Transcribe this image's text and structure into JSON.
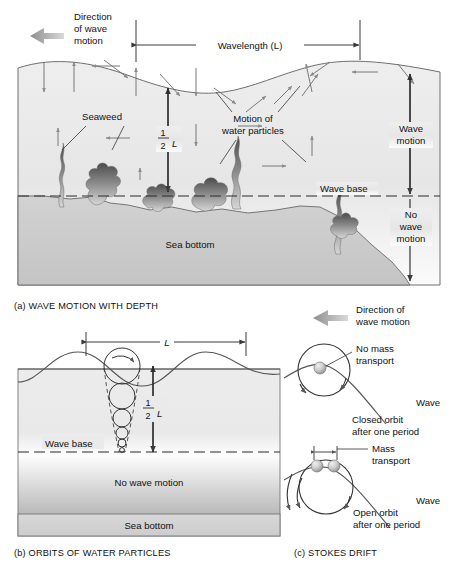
{
  "figure": {
    "panels": [
      {
        "id": "a",
        "caption": "(a) WAVE MOTION WITH DEPTH",
        "labels": {
          "direction": "Direction\nof wave\nmotion",
          "direction_l1": "Direction",
          "direction_l2": "of wave",
          "direction_l3": "motion",
          "wavelength": "Wavelength (L)",
          "half_l_num": "1",
          "half_l_den": "2",
          "half_l_sym": "L",
          "seaweed": "Seaweed",
          "motion_l1": "Motion of",
          "motion_l2": "water particles",
          "wave_base": "Wave base",
          "wave_motion_l1": "Wave",
          "wave_motion_l2": "motion",
          "no_wave_l1": "No",
          "no_wave_l2": "wave",
          "no_wave_l3": "motion",
          "sea_bottom": "Sea bottom"
        }
      },
      {
        "id": "b",
        "caption": "(b) ORBITS OF WATER PARTICLES",
        "labels": {
          "wavelength_sym": "L",
          "half_l_num": "1",
          "half_l_den": "2",
          "half_l_sym": "L",
          "wave_base": "Wave base",
          "no_wave_motion": "No wave motion",
          "sea_bottom": "Sea bottom"
        }
      },
      {
        "id": "c",
        "caption": "(c) STOKES DRIFT",
        "labels": {
          "direction_l1": "Direction of",
          "direction_l2": "wave motion",
          "no_mass_l1": "No mass",
          "no_mass_l2": "transport",
          "closed_l1": "Closed orbit",
          "closed_l2": "after one period",
          "wave_top": "Wave",
          "mass_l1": "Mass",
          "mass_l2": "transport",
          "open_l1": "Open orbit",
          "open_l2": "after one period",
          "wave_bottom": "Wave"
        }
      }
    ]
  },
  "colors": {
    "water_light": "#f2f2f2",
    "water_mid": "#e3e3e3",
    "seabed": "#cfcfcf",
    "seabed_dark": "#b9b9b9",
    "line": "#3a3a3a",
    "arrow_gray": "#9a9a9a",
    "text": "#111111",
    "sphere": "#c8c8c8"
  }
}
